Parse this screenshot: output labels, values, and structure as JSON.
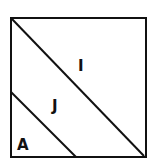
{
  "diagram": {
    "regions": [
      {
        "id": "upper-right",
        "label": "I"
      },
      {
        "id": "middle-band",
        "label": "J"
      },
      {
        "id": "lower-left",
        "label": "A"
      }
    ],
    "colors": {
      "stroke": "#111111",
      "background": "#ffffff"
    }
  }
}
